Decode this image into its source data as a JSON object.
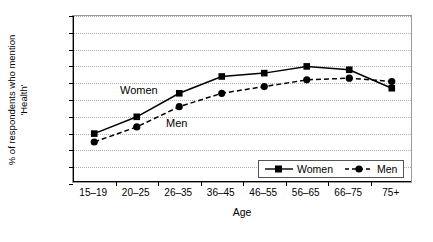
{
  "chart_data": {
    "type": "line",
    "title": "",
    "xlabel": "Age",
    "ylabel": "% of respondents who mention 'Health'",
    "ylabel_line1": "% of respondents who mention",
    "ylabel_line2": "'Health'",
    "categories": [
      "15–19",
      "20–25",
      "26–35",
      "36–45",
      "46–55",
      "56–65",
      "66–75",
      "75+"
    ],
    "ylim": [
      0,
      100
    ],
    "ytick_step": 10,
    "yticks": [
      0,
      10,
      20,
      30,
      40,
      50,
      60,
      70,
      80,
      90,
      100
    ],
    "grid": true,
    "legend_position": "inside-bottom-right",
    "series": [
      {
        "name": "Women",
        "values": [
          30,
          40,
          54,
          64,
          66,
          70,
          68,
          57
        ],
        "marker": "square",
        "line_style": "solid",
        "color": "#000000"
      },
      {
        "name": "Men",
        "values": [
          25,
          34,
          46,
          54,
          58,
          62,
          63,
          61
        ],
        "marker": "circle",
        "line_style": "dashed",
        "color": "#000000"
      }
    ],
    "annotations": [
      {
        "text": "Women",
        "series": "Women"
      },
      {
        "text": "Men",
        "series": "Men"
      }
    ]
  },
  "legend": {
    "items": [
      {
        "label": "Women",
        "marker": "square",
        "line_style": "solid"
      },
      {
        "label": "Men",
        "marker": "circle",
        "line_style": "dashed"
      }
    ]
  }
}
